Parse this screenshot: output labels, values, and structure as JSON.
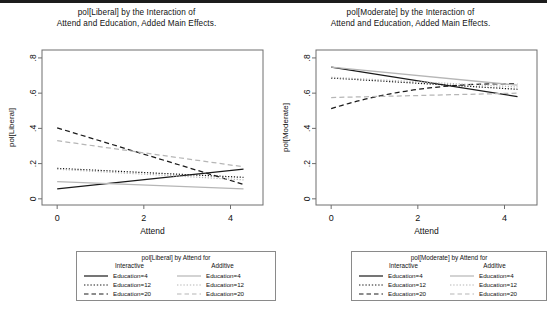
{
  "panels": [
    {
      "id": "liberal",
      "title_line1": "pol[Liberal] by the Interaction of",
      "title_line2": "Attend and Education, Added Main Effects.",
      "ylabel": "pol[Liberal]",
      "xlabel": "Attend",
      "legend": {
        "title": "pol[Liberal] by Attend for",
        "col1_head": "Interactive",
        "col2_head": "Additive",
        "rows": [
          {
            "label1": "Education=4",
            "label2": "Education=4"
          },
          {
            "label1": "Education=12",
            "label2": "Education=12"
          },
          {
            "label1": "Education=20",
            "label2": "Education=20"
          }
        ]
      }
    },
    {
      "id": "moderate",
      "title_line1": "pol[Moderate] by the Interaction of",
      "title_line2": "Attend and Education, Added Main Effects.",
      "ylabel": "pol[Moderate]",
      "xlabel": "Attend",
      "legend": {
        "title": "pol[Moderate] by Attend for",
        "col1_head": "Interactive",
        "col2_head": "Additive",
        "rows": [
          {
            "label1": "Education=4",
            "label2": "Education=4"
          },
          {
            "label1": "Education=12",
            "label2": "Education=12"
          },
          {
            "label1": "Education=20",
            "label2": "Education=20"
          }
        ]
      }
    }
  ],
  "colors": {
    "interactive": "#1a1a1a",
    "additive": "#b6b6b6",
    "frame": "#6e6e6e",
    "text": "#111111"
  },
  "chart_data": [
    {
      "type": "line",
      "title": "pol[Liberal] by the Interaction of Attend and Education, Added Main Effects.",
      "xlabel": "Attend",
      "ylabel": "pol[Liberal]",
      "xlim": [
        -0.35,
        4.75
      ],
      "ylim": [
        -0.035,
        0.845
      ],
      "xticks": [
        0,
        2,
        4
      ],
      "xticklabels": [
        "0",
        "2",
        "4"
      ],
      "yticks": [
        0,
        0.2,
        0.4,
        0.6,
        0.8
      ],
      "yticklabels": [
        "0",
        ".2",
        ".4",
        ".6",
        ".8"
      ],
      "grid": false,
      "legend_position": "below",
      "x": [
        0,
        4.3
      ],
      "series": [
        {
          "name": "Interactive Education=4",
          "style": "solid",
          "color": "#1a1a1a",
          "values": [
            0.057,
            0.168
          ]
        },
        {
          "name": "Interactive Education=12",
          "style": "dotted",
          "color": "#1a1a1a",
          "values": [
            0.173,
            0.122
          ]
        },
        {
          "name": "Interactive Education=20",
          "style": "dashed",
          "color": "#1a1a1a",
          "values": [
            0.403,
            0.082
          ]
        },
        {
          "name": "Additive Education=4",
          "style": "solid",
          "color": "#b6b6b6",
          "values": [
            0.098,
            0.056
          ]
        },
        {
          "name": "Additive Education=12",
          "style": "dotted",
          "color": "#b6b6b6",
          "values": [
            0.168,
            0.108
          ]
        },
        {
          "name": "Additive Education=20",
          "style": "dashed",
          "color": "#b6b6b6",
          "values": [
            0.33,
            0.182
          ]
        }
      ]
    },
    {
      "type": "line",
      "title": "pol[Moderate] by the Interaction of Attend and Education, Added Main Effects.",
      "xlabel": "Attend",
      "ylabel": "pol[Moderate]",
      "xlim": [
        -0.35,
        4.75
      ],
      "ylim": [
        -0.035,
        0.845
      ],
      "xticks": [
        0,
        2,
        4
      ],
      "xticklabels": [
        "0",
        "2",
        "4"
      ],
      "yticks": [
        0,
        0.2,
        0.4,
        0.6,
        0.8
      ],
      "yticklabels": [
        "0",
        ".2",
        ".4",
        ".6",
        ".8"
      ],
      "grid": false,
      "legend_position": "below",
      "x": [
        0,
        4.3
      ],
      "series": [
        {
          "name": "Interactive Education=4",
          "style": "solid",
          "color": "#1a1a1a",
          "values": [
            0.748,
            0.58
          ]
        },
        {
          "name": "Interactive Education=12",
          "style": "dotted",
          "color": "#1a1a1a",
          "values": [
            0.686,
            0.622
          ]
        },
        {
          "name": "Interactive Education=20",
          "style": "dashed",
          "color": "#1a1a1a",
          "values": [
            0.512,
            0.652
          ],
          "curve": true
        },
        {
          "name": "Additive Education=4",
          "style": "solid",
          "color": "#b6b6b6",
          "values": [
            0.748,
            0.645
          ]
        },
        {
          "name": "Additive Education=12",
          "style": "dotted",
          "color": "#b6b6b6",
          "values": [
            0.69,
            0.635
          ]
        },
        {
          "name": "Additive Education=20",
          "style": "dashed",
          "color": "#b6b6b6",
          "values": [
            0.575,
            0.6
          ]
        }
      ]
    }
  ]
}
